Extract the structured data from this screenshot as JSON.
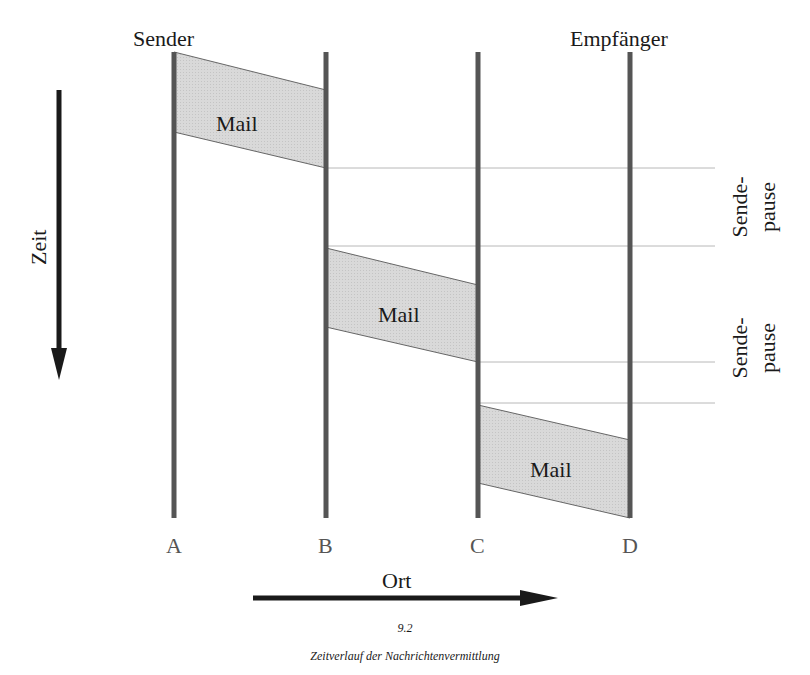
{
  "diagram": {
    "top_labels": {
      "sender": "Sender",
      "receiver": "Empfänger"
    },
    "time_axis": {
      "label": "Zeit",
      "direction": "down"
    },
    "place_axis": {
      "label": "Ort",
      "direction": "right"
    },
    "nodes": [
      "A",
      "B",
      "C",
      "D"
    ],
    "messages": [
      {
        "label": "Mail",
        "from": "A",
        "to": "B"
      },
      {
        "label": "Mail",
        "from": "B",
        "to": "C"
      },
      {
        "label": "Mail",
        "from": "C",
        "to": "D"
      }
    ],
    "pauses": [
      {
        "line1": "Sende-",
        "line2": "pause"
      },
      {
        "line1": "Sende-",
        "line2": "pause"
      }
    ],
    "colors": {
      "node_line": "#555555",
      "mail_fill": "#d6d6d6",
      "mail_edge": "#555555",
      "guide_line": "#b0b0b0",
      "arrow": "#1a1a1a"
    }
  },
  "caption": {
    "number": "9.2",
    "title": "Zeitverlauf der Nachrichtenvermittlung"
  }
}
